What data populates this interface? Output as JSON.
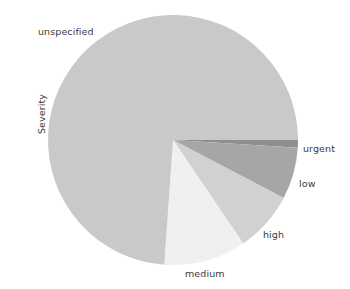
{
  "figure": {
    "background_color": "#ffffff",
    "axis_label": "Severity"
  },
  "chart_data": {
    "type": "pie",
    "title": "",
    "xlabel": "",
    "ylabel": "Severity",
    "legend_position": "none",
    "grid": false,
    "labels_outside": true,
    "start_angle_deg": 0,
    "direction": "clockwise",
    "center": {
      "x": 173,
      "y": 140
    },
    "radius": 125,
    "categories": [
      "urgent",
      "low",
      "high",
      "medium",
      "unspecified"
    ],
    "values": [
      1.0,
      6.7,
      7.8,
      10.6,
      73.9
    ],
    "value_unit": "percent",
    "angles_deg": [
      3.6,
      24.1,
      28.1,
      38.2,
      266.0
    ],
    "colors": [
      "#8f8f8f",
      "#a6a6a6",
      "#d1d1d1",
      "#f0f0f0",
      "#c9c9c9"
    ],
    "slices": [
      {
        "label": "urgent",
        "value": 1.0,
        "angle_deg": 3.6,
        "color": "#8f8f8f"
      },
      {
        "label": "low",
        "value": 6.7,
        "angle_deg": 24.1,
        "color": "#a6a6a6"
      },
      {
        "label": "high",
        "value": 7.8,
        "angle_deg": 28.1,
        "color": "#d1d1d1"
      },
      {
        "label": "medium",
        "value": 10.6,
        "angle_deg": 38.2,
        "color": "#f0f0f0"
      },
      {
        "label": "unspecified",
        "value": 73.9,
        "angle_deg": 266.0,
        "color": "#c9c9c9"
      }
    ]
  },
  "labels": {
    "unspecified": "unspecified",
    "urgent": "urgent",
    "low": "low",
    "high": "high",
    "medium": "medium"
  }
}
